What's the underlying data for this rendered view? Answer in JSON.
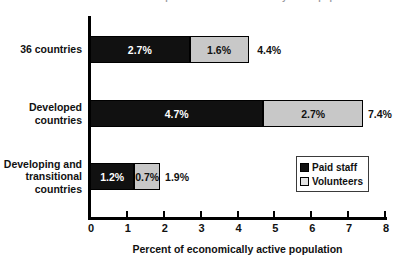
{
  "chart_data": {
    "type": "bar",
    "orientation": "horizontal",
    "stacked": true,
    "title": "Paid staff and volunteers as a percent of the economically active population",
    "xlabel": "Percent of economically active population",
    "ylabel": "",
    "xlim": [
      0,
      8
    ],
    "xticks": [
      "0",
      "1",
      "2",
      "3",
      "4",
      "5",
      "6",
      "7",
      "8"
    ],
    "grid": false,
    "legend_position": "inside-right",
    "categories": [
      "36 countries",
      "Developed countries",
      "Developing and transitional countries"
    ],
    "category_lines": [
      [
        "36 countries"
      ],
      [
        "Developed",
        "countries"
      ],
      [
        "Developing and",
        "transitional",
        "countries"
      ]
    ],
    "series": [
      {
        "name": "Paid staff",
        "color": "#111111",
        "values": [
          2.7,
          4.7,
          1.2
        ],
        "labels": [
          "2.7%",
          "4.7%",
          "1.2%"
        ]
      },
      {
        "name": "Volunteers",
        "color": "#c8c8c8",
        "values": [
          1.6,
          2.7,
          0.7
        ],
        "labels": [
          "1.6%",
          "2.7%",
          "0.7%"
        ]
      }
    ],
    "totals": [
      4.4,
      7.4,
      1.9
    ],
    "total_labels": [
      "4.4%",
      "7.4%",
      "1.9%"
    ]
  },
  "legend": {
    "items": [
      {
        "label": "Paid staff"
      },
      {
        "label": "Volunteers"
      }
    ]
  }
}
